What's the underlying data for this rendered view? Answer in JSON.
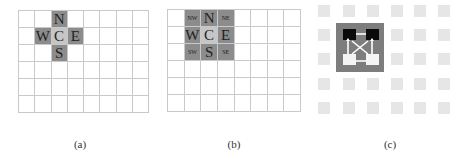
{
  "panels": [
    {
      "id": "a",
      "caption": "(a)",
      "grid": {
        "columns": 8,
        "rows": 6
      },
      "highlighted": [
        {
          "row": 0,
          "col": 2,
          "label": "N",
          "kind": "main"
        },
        {
          "row": 1,
          "col": 1,
          "label": "W",
          "kind": "main"
        },
        {
          "row": 1,
          "col": 2,
          "label": "C",
          "kind": "center"
        },
        {
          "row": 1,
          "col": 3,
          "label": "E",
          "kind": "main"
        },
        {
          "row": 2,
          "col": 2,
          "label": "S",
          "kind": "main"
        }
      ]
    },
    {
      "id": "b",
      "caption": "(b)",
      "grid": {
        "columns": 8,
        "rows": 6
      },
      "highlighted": [
        {
          "row": 0,
          "col": 1,
          "label": "NW",
          "kind": "diag"
        },
        {
          "row": 0,
          "col": 2,
          "label": "N",
          "kind": "main"
        },
        {
          "row": 0,
          "col": 3,
          "label": "NE",
          "kind": "diag"
        },
        {
          "row": 1,
          "col": 1,
          "label": "W",
          "kind": "main"
        },
        {
          "row": 1,
          "col": 2,
          "label": "C",
          "kind": "center"
        },
        {
          "row": 1,
          "col": 3,
          "label": "E",
          "kind": "main"
        },
        {
          "row": 2,
          "col": 1,
          "label": "SW",
          "kind": "diag"
        },
        {
          "row": 2,
          "col": 2,
          "label": "S",
          "kind": "main"
        },
        {
          "row": 2,
          "col": 3,
          "label": "SE",
          "kind": "diag"
        }
      ]
    },
    {
      "id": "c",
      "caption": "(c)",
      "array": {
        "columns": 6,
        "rows": 5
      },
      "cluster": {
        "top_cores": "black",
        "bottom_cores": "white",
        "connections": "crossbar arrows"
      }
    }
  ],
  "colors": {
    "grid_line": "#c9c9c9",
    "neighbor_cell": "#8c8c8c",
    "center_cell": "#c6c6c6",
    "pe_tile": "#e6e6e6",
    "cluster_block": "#7d7d7d"
  }
}
